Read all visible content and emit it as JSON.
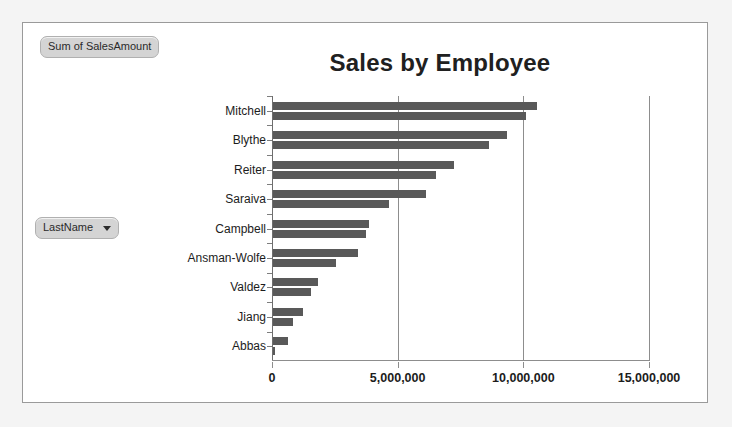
{
  "panel": {
    "value_field_label": "Sum of SalesAmount",
    "axis_field_label": "LastName",
    "axis_field_caret": "chevron-down-icon"
  },
  "chart_data": {
    "type": "bar",
    "title": "Sales by Employee",
    "orientation": "horizontal",
    "xlabel": "",
    "ylabel": "",
    "grid": true,
    "legend": false,
    "xlim": [
      0,
      15000000
    ],
    "xticks": [
      0,
      5000000,
      10000000,
      15000000
    ],
    "xtick_labels": [
      "0",
      "5,000,000",
      "10,000,000",
      "15,000,000"
    ],
    "categories": [
      "Mitchell",
      "Blythe",
      "Reiter",
      "Saraiva",
      "Campbell",
      "Ansman-Wolfe",
      "Valdez",
      "Jiang",
      "Abbas"
    ],
    "series": [
      {
        "name": "Sum of SalesAmount (bar A)",
        "values": [
          10500000,
          9300000,
          7200000,
          6100000,
          3800000,
          3400000,
          1800000,
          1200000,
          600000
        ]
      },
      {
        "name": "Sum of SalesAmount (bar B)",
        "values": [
          10060000,
          8600000,
          6500000,
          4600000,
          3700000,
          2500000,
          1500000,
          800000,
          60000
        ]
      }
    ],
    "bar_color": "#595959",
    "grid_color": "#8d8d8d",
    "plot_background": "#ffffff"
  }
}
